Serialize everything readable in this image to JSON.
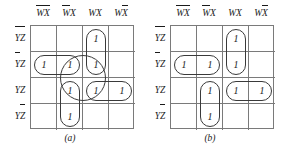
{
  "figure": {
    "kmaps": [
      {
        "caption": "(a)",
        "col_headers": [
          {
            "vars": [
              {
                "t": "W",
                "bar": true
              },
              {
                "t": "X",
                "bar": true
              }
            ],
            "plain": "W̅X̅"
          },
          {
            "vars": [
              {
                "t": "W",
                "bar": true
              },
              {
                "t": "X",
                "bar": false
              }
            ],
            "plain": "W̅X"
          },
          {
            "vars": [
              {
                "t": "W",
                "bar": false
              },
              {
                "t": "X",
                "bar": false
              }
            ],
            "plain": "WX"
          },
          {
            "vars": [
              {
                "t": "W",
                "bar": false
              },
              {
                "t": "X",
                "bar": true
              }
            ],
            "plain": "WX̅"
          }
        ],
        "row_headers": [
          {
            "vars": [
              {
                "t": "Y",
                "bar": true
              },
              {
                "t": "Z",
                "bar": true
              }
            ],
            "plain": "Y̅Z̅"
          },
          {
            "vars": [
              {
                "t": "Y",
                "bar": true
              },
              {
                "t": "Z",
                "bar": false
              }
            ],
            "plain": "Y̅Z"
          },
          {
            "vars": [
              {
                "t": "Y",
                "bar": false
              },
              {
                "t": "Z",
                "bar": false
              }
            ],
            "plain": "YZ"
          },
          {
            "vars": [
              {
                "t": "Y",
                "bar": false
              },
              {
                "t": "Z",
                "bar": true
              }
            ],
            "plain": "YZ̅"
          }
        ],
        "cells": [
          [
            "",
            "",
            "1",
            ""
          ],
          [
            "1",
            "1",
            "1",
            ""
          ],
          [
            "",
            "1",
            "1",
            "1"
          ],
          [
            "",
            "1",
            "",
            ""
          ]
        ],
        "loops": [
          {
            "name": "loop-wx-ybar-col3",
            "row": 0,
            "col": 2,
            "rows": 2,
            "cols": 1,
            "shape": "vertical-pair"
          },
          {
            "name": "loop-ybarz-row2-left",
            "row": 1,
            "col": 0,
            "rows": 1,
            "cols": 2,
            "shape": "horizontal-pair"
          },
          {
            "name": "loop-square-r2r3-c2c3",
            "row": 1,
            "col": 1,
            "rows": 2,
            "cols": 2,
            "shape": "square-quad"
          },
          {
            "name": "loop-yz-row3-right",
            "row": 2,
            "col": 2,
            "rows": 1,
            "cols": 2,
            "shape": "horizontal-pair"
          },
          {
            "name": "loop-wbarx-col2-r3r4",
            "row": 2,
            "col": 1,
            "rows": 2,
            "cols": 1,
            "shape": "vertical-pair"
          }
        ]
      },
      {
        "caption": "(b)",
        "col_headers": [
          {
            "vars": [
              {
                "t": "W",
                "bar": true
              },
              {
                "t": "X",
                "bar": true
              }
            ],
            "plain": "W̅X̅"
          },
          {
            "vars": [
              {
                "t": "W",
                "bar": true
              },
              {
                "t": "X",
                "bar": false
              }
            ],
            "plain": "W̅X"
          },
          {
            "vars": [
              {
                "t": "W",
                "bar": false
              },
              {
                "t": "X",
                "bar": false
              }
            ],
            "plain": "WX"
          },
          {
            "vars": [
              {
                "t": "W",
                "bar": false
              },
              {
                "t": "X",
                "bar": true
              }
            ],
            "plain": "WX̅"
          }
        ],
        "row_headers": [
          {
            "vars": [
              {
                "t": "Y",
                "bar": true
              },
              {
                "t": "Z",
                "bar": true
              }
            ],
            "plain": "Y̅Z̅"
          },
          {
            "vars": [
              {
                "t": "Y",
                "bar": true
              },
              {
                "t": "Z",
                "bar": false
              }
            ],
            "plain": "Y̅Z"
          },
          {
            "vars": [
              {
                "t": "Y",
                "bar": false
              },
              {
                "t": "Z",
                "bar": false
              }
            ],
            "plain": "YZ"
          },
          {
            "vars": [
              {
                "t": "Y",
                "bar": false
              },
              {
                "t": "Z",
                "bar": true
              }
            ],
            "plain": "YZ̅"
          }
        ],
        "cells": [
          [
            "",
            "",
            "1",
            ""
          ],
          [
            "1",
            "1",
            "1",
            ""
          ],
          [
            "",
            "1",
            "1",
            "1"
          ],
          [
            "",
            "1",
            "",
            ""
          ]
        ],
        "loops": [
          {
            "name": "loop-wx-ybar-col3",
            "row": 0,
            "col": 2,
            "rows": 2,
            "cols": 1,
            "shape": "vertical-pair"
          },
          {
            "name": "loop-ybarz-row2-left",
            "row": 1,
            "col": 0,
            "rows": 1,
            "cols": 2,
            "shape": "horizontal-pair"
          },
          {
            "name": "loop-yz-row3-right",
            "row": 2,
            "col": 2,
            "rows": 1,
            "cols": 2,
            "shape": "horizontal-pair"
          },
          {
            "name": "loop-wbarx-col2-r3r4",
            "row": 2,
            "col": 1,
            "rows": 2,
            "cols": 1,
            "shape": "vertical-pair"
          }
        ]
      }
    ],
    "colors": {
      "grid_line": "#7a7a7a",
      "loop_line": "#3a3a3a",
      "text": "#1a1a1a",
      "background": "#ffffff"
    }
  }
}
